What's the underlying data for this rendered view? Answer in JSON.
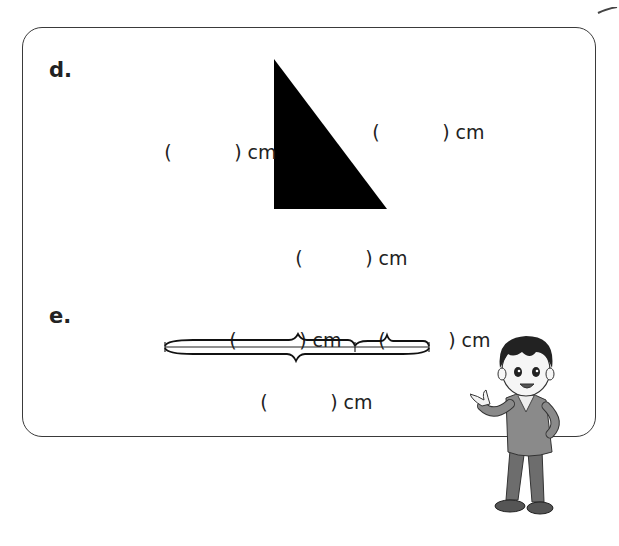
{
  "section_d": {
    "label": "d.",
    "shape": "right-triangle",
    "blanks": {
      "left_side": {
        "open": "(",
        "close": ") cm"
      },
      "hypotenuse": {
        "open": "(",
        "close": ") cm"
      },
      "bottom_side": {
        "open": "(",
        "close": ") cm"
      }
    }
  },
  "section_e": {
    "label": "e.",
    "shape": "segmented-line-with-braces",
    "blanks": {
      "top_left": {
        "open": "(",
        "close": ") cm"
      },
      "top_right": {
        "open": "(",
        "close": ") cm"
      },
      "bottom_total": {
        "open": "(",
        "close": ") cm"
      }
    }
  },
  "colors": {
    "border": "#3a3a3a",
    "text": "#222222",
    "triangle_fill": "#000000"
  }
}
